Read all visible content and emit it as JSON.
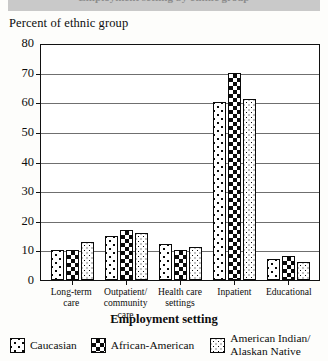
{
  "banner": {
    "ghost_text": "Employment setting by ethnic group"
  },
  "axis": {
    "ylabel": "Percent of ethnic group",
    "xlabel": "Employment setting",
    "yticks": [
      0,
      10,
      20,
      30,
      40,
      50,
      60,
      70,
      80
    ]
  },
  "legend": {
    "items": [
      {
        "label": "Caucasian",
        "pattern": "dots-large",
        "swatch_name": "legend-swatch-caucasian"
      },
      {
        "label": "African-American",
        "pattern": "checkerboard",
        "swatch_name": "legend-swatch-african-american"
      },
      {
        "label_line1": "American Indian/",
        "label_line2": "Alaskan Native",
        "pattern": "dots-fine",
        "swatch_name": "legend-swatch-american-indian"
      }
    ]
  },
  "xlabels": [
    {
      "line1": "Long-term",
      "line2": "care"
    },
    {
      "line1": "Outpatient/",
      "line2": "community care"
    },
    {
      "line1": "Health care",
      "line2": "settings"
    },
    {
      "line1": "Inpatient",
      "line2": ""
    },
    {
      "line1": "Educational",
      "line2": ""
    }
  ],
  "chart_data": {
    "type": "bar",
    "title": "Employment setting by ethnic group",
    "xlabel": "Employment setting",
    "ylabel": "Percent of ethnic group",
    "ylim": [
      0,
      80
    ],
    "ytick_step": 10,
    "grid": true,
    "legend_position": "bottom",
    "categories": [
      "Long-term care",
      "Outpatient/community care",
      "Health care settings",
      "Inpatient",
      "Educational"
    ],
    "series": [
      {
        "name": "Caucasian",
        "values": [
          10,
          15,
          12,
          60,
          7
        ]
      },
      {
        "name": "African-American",
        "values": [
          10,
          17,
          10,
          70,
          8
        ]
      },
      {
        "name": "American Indian/Alaskan Native",
        "values": [
          13,
          16,
          11,
          61,
          6
        ]
      }
    ]
  }
}
